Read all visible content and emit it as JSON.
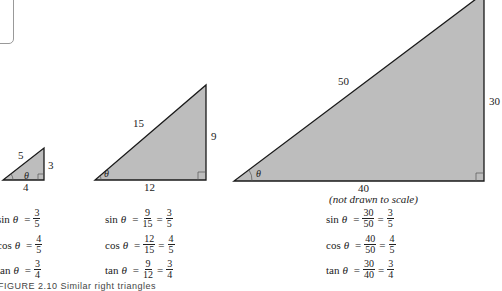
{
  "figure": {
    "triangles": [
      {
        "id": "small",
        "hypotenuse": "5",
        "opposite": "3",
        "adjacent": "4",
        "angle": "θ",
        "equations": [
          {
            "fn": "sin",
            "var": "θ",
            "fracs": [
              {
                "n": "3",
                "d": "5"
              }
            ]
          },
          {
            "fn": "cos",
            "var": "θ",
            "fracs": [
              {
                "n": "4",
                "d": "5"
              }
            ]
          },
          {
            "fn": "tan",
            "var": "θ",
            "fracs": [
              {
                "n": "3",
                "d": "4"
              }
            ]
          }
        ]
      },
      {
        "id": "medium",
        "hypotenuse": "15",
        "opposite": "9",
        "adjacent": "12",
        "angle": "θ",
        "equations": [
          {
            "fn": "sin",
            "var": "θ",
            "fracs": [
              {
                "n": "9",
                "d": "15"
              },
              {
                "n": "3",
                "d": "5"
              }
            ]
          },
          {
            "fn": "cos",
            "var": "θ",
            "fracs": [
              {
                "n": "12",
                "d": "15"
              },
              {
                "n": "4",
                "d": "5"
              }
            ]
          },
          {
            "fn": "tan",
            "var": "θ",
            "fracs": [
              {
                "n": "9",
                "d": "12"
              },
              {
                "n": "3",
                "d": "4"
              }
            ]
          }
        ]
      },
      {
        "id": "large",
        "hypotenuse": "50",
        "opposite": "30",
        "adjacent": "40",
        "angle": "θ",
        "note": "(not drawn to scale)",
        "equations": [
          {
            "fn": "sin",
            "var": "θ",
            "fracs": [
              {
                "n": "30",
                "d": "50"
              },
              {
                "n": "3",
                "d": "5"
              }
            ]
          },
          {
            "fn": "cos",
            "var": "θ",
            "fracs": [
              {
                "n": "40",
                "d": "50"
              },
              {
                "n": "4",
                "d": "5"
              }
            ]
          },
          {
            "fn": "tan",
            "var": "θ",
            "fracs": [
              {
                "n": "30",
                "d": "40"
              },
              {
                "n": "3",
                "d": "4"
              }
            ]
          }
        ]
      }
    ],
    "equals": "=",
    "caption": "FIGURE 2.10  Similar right triangles",
    "colors": {
      "fill": "#bdbdbd",
      "stroke": "#1a1a1a"
    }
  }
}
